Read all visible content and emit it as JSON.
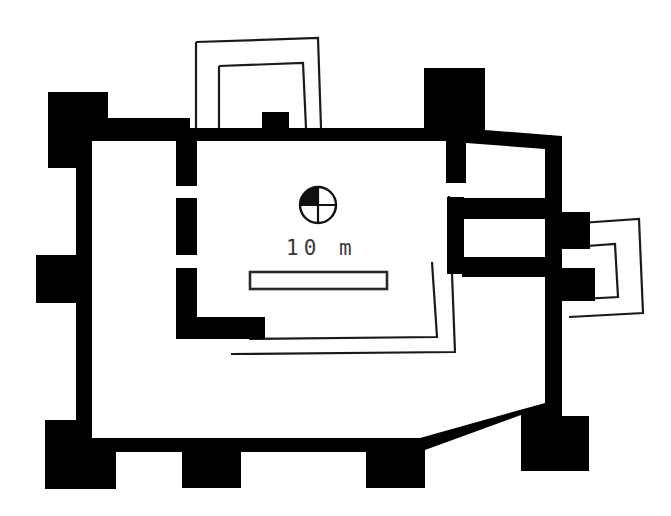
{
  "figure": {
    "kind": "archaeological-site-plan",
    "background_color": "#ffffff",
    "wall_fill_color": "#000000",
    "outline_stroke_color": "#1a1a1a",
    "width": 671,
    "height": 516
  },
  "scale": {
    "label": "10 m",
    "bar_length_px": 137,
    "bar_x": 250,
    "bar_y": 272,
    "bar_height": 17,
    "label_x": 286,
    "label_y": 255
  },
  "compass": {
    "name": "north-arrow",
    "center_x": 318,
    "center_y": 205,
    "radius": 18,
    "filled_quadrant": "upper-left"
  },
  "structures": {
    "outer_enclosure": {
      "label": "outer fortification wall with corner towers and buttresses",
      "path": "M 48 92 L 108 92 L 108 119 L 190 119 L 190 104 L 196 104 L 196 128 L 262 128 L 262 112 L 288 112 L 288 128 L 424 128 L 424 68 L 484 68 L 484 129 L 561 135 L 561 212 L 589 212 L 589 248 L 561 248 L 561 268 L 594 268 L 594 300 L 561 300 L 561 415 L 588 415 L 588 470 L 520 470 L 520 414 L 424 452 L 424 487 L 366 487 L 366 452 L 240 452 L 240 487 L 182 487 L 182 452 L 115 452 L 115 488 L 45 488 L 45 420 L 75 420 L 75 302 L 36 302 L 36 255 L 75 255 L 75 168 L 48 168 Z",
      "inner_cut": "M 92 140 L 176 140 L 176 184 L 196 184 L 196 140 L 446 140 L 446 182 L 466 182 L 466 142 L 544 148 L 544 197 L 462 197 L 462 218 L 544 218 L 544 256 L 462 256 L 462 276 L 544 276 L 544 402 L 420 438 L 92 438 Z"
    },
    "inner_courtyard_wall": {
      "label": "inner enclosure wall (excavated, solid)",
      "segments": [
        "M 176 140 L 196 140 L 196 184 L 176 184 Z",
        "M 176 196 L 196 196 L 196 254 L 176 254 Z",
        "M 176 266 L 196 266 L 196 328 L 176 328 Z",
        "M 176 316 L 264 316 L 264 338 L 176 338 Z",
        "M 446 140 L 466 140 L 466 182 L 446 182 Z",
        "M 446 196 L 466 196 L 466 272 L 446 272 Z"
      ]
    },
    "reconstructed_lines": {
      "label": "hypothetical / reconstructed wall outlines (thin line)",
      "north_gate_outer": "M 196 42 L 317 38 L 319 128",
      "north_gate_inner": "M 219 66 L 303 64 L 305 128",
      "east_gate_outer": "M 572 224 L 638 219 L 641 311 L 577 315",
      "east_gate_inner": "M 571 247 L 616 243 L 618 296 L 576 299",
      "south_inner_outer": "M 448 198 L 452 350 L 232 352",
      "south_inner_inner": "M 430 274 L 434 336 L 252 338"
    }
  },
  "annotations": {
    "north_label": "",
    "title": ""
  }
}
